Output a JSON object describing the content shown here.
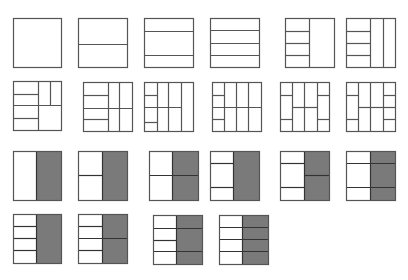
{
  "diagram": {
    "colors": {
      "background": "#ffffff",
      "stroke": "#555555",
      "stroke_dark": "#333333",
      "shade": "#7a7a7a"
    },
    "squares": [
      {
        "id": "r1c1",
        "x": 13,
        "y": 18,
        "w": 48,
        "h": 49,
        "shade": null,
        "lines": []
      },
      {
        "id": "r1c2",
        "x": 78,
        "y": 18,
        "w": 49,
        "h": 49,
        "shade": null,
        "lines": [
          [
            78,
            44,
            127,
            44
          ]
        ]
      },
      {
        "id": "r1c3",
        "x": 144,
        "y": 18,
        "w": 49,
        "h": 49,
        "shade": null,
        "lines": [
          [
            144,
            31,
            193,
            31
          ],
          [
            144,
            55,
            193,
            55
          ]
        ]
      },
      {
        "id": "r1c4",
        "x": 210,
        "y": 18,
        "w": 49,
        "h": 49,
        "shade": null,
        "lines": [
          [
            210,
            30,
            259,
            30
          ],
          [
            210,
            43,
            259,
            43
          ],
          [
            210,
            55,
            259,
            55
          ]
        ]
      },
      {
        "id": "r1c5",
        "x": 285,
        "y": 18,
        "w": 49,
        "h": 49,
        "shade": null,
        "lines": [
          [
            309,
            18,
            309,
            67
          ],
          [
            285,
            31,
            309,
            31
          ],
          [
            285,
            43,
            309,
            43
          ],
          [
            285,
            55,
            309,
            55
          ]
        ]
      },
      {
        "id": "r1c6",
        "x": 346,
        "y": 18,
        "w": 49,
        "h": 49,
        "shade": null,
        "lines": [
          [
            370,
            18,
            370,
            67
          ],
          [
            383,
            18,
            383,
            67
          ],
          [
            346,
            31,
            370,
            31
          ],
          [
            346,
            43,
            370,
            43
          ],
          [
            346,
            55,
            370,
            55
          ]
        ]
      },
      {
        "id": "r2c1",
        "x": 13,
        "y": 81,
        "w": 48,
        "h": 49,
        "shade": null,
        "lines": [
          [
            38,
            81,
            38,
            130
          ],
          [
            13,
            105,
            61,
            105
          ],
          [
            13,
            94,
            38,
            94
          ],
          [
            50,
            81,
            50,
            105
          ],
          [
            13,
            118,
            38,
            118
          ]
        ]
      },
      {
        "id": "r2c2",
        "x": 83,
        "y": 82,
        "w": 49,
        "h": 49,
        "shade": null,
        "lines": [
          [
            108,
            82,
            108,
            131
          ],
          [
            119,
            82,
            119,
            131
          ],
          [
            83,
            108,
            132,
            108
          ],
          [
            83,
            95,
            108,
            95
          ],
          [
            83,
            119,
            108,
            119
          ]
        ]
      },
      {
        "id": "r2c3",
        "x": 144,
        "y": 82,
        "w": 49,
        "h": 49,
        "shade": null,
        "lines": [
          [
            157,
            82,
            157,
            131
          ],
          [
            168,
            82,
            168,
            131
          ],
          [
            181,
            82,
            181,
            131
          ],
          [
            144,
            107,
            181,
            107
          ],
          [
            144,
            95,
            157,
            95
          ],
          [
            144,
            122,
            157,
            122
          ]
        ]
      },
      {
        "id": "r2c4",
        "x": 212,
        "y": 82,
        "w": 49,
        "h": 49,
        "shade": null,
        "lines": [
          [
            224,
            82,
            224,
            131
          ],
          [
            236,
            82,
            236,
            131
          ],
          [
            248,
            82,
            248,
            131
          ],
          [
            212,
            107,
            261,
            107
          ],
          [
            212,
            95,
            224,
            95
          ],
          [
            212,
            119,
            224,
            119
          ]
        ]
      },
      {
        "id": "r2c5",
        "x": 280,
        "y": 82,
        "w": 49,
        "h": 49,
        "shade": null,
        "lines": [
          [
            292,
            82,
            292,
            131
          ],
          [
            304,
            82,
            304,
            131
          ],
          [
            317,
            82,
            317,
            131
          ],
          [
            292,
            107,
            317,
            107
          ],
          [
            280,
            95,
            292,
            95
          ],
          [
            280,
            119,
            292,
            119
          ],
          [
            317,
            95,
            329,
            95
          ],
          [
            317,
            119,
            329,
            119
          ]
        ]
      },
      {
        "id": "r2c6",
        "x": 346,
        "y": 82,
        "w": 49,
        "h": 49,
        "shade": null,
        "lines": [
          [
            358,
            82,
            358,
            131
          ],
          [
            370,
            82,
            370,
            131
          ],
          [
            383,
            82,
            383,
            131
          ],
          [
            358,
            107,
            383,
            107
          ],
          [
            346,
            95,
            358,
            95
          ],
          [
            346,
            119,
            358,
            119
          ],
          [
            383,
            95,
            395,
            95
          ],
          [
            383,
            107,
            395,
            107
          ],
          [
            383,
            119,
            395,
            119
          ]
        ]
      },
      {
        "id": "r3c1",
        "x": 13,
        "y": 151,
        "w": 48,
        "h": 49,
        "shade": {
          "x": 36,
          "w": 25
        },
        "lines": [
          [
            36,
            151,
            36,
            200
          ]
        ]
      },
      {
        "id": "r3c2",
        "x": 78,
        "y": 151,
        "w": 49,
        "h": 49,
        "shade": {
          "x": 102,
          "w": 25
        },
        "lines": [
          [
            102,
            151,
            102,
            200
          ],
          [
            78,
            175,
            102,
            175
          ]
        ]
      },
      {
        "id": "r3c3",
        "x": 149,
        "y": 151,
        "w": 49,
        "h": 49,
        "shade": {
          "x": 172,
          "w": 26
        },
        "lines": [
          [
            172,
            151,
            172,
            200
          ],
          [
            149,
            175,
            198,
            175
          ]
        ]
      },
      {
        "id": "r3c4",
        "x": 210,
        "y": 151,
        "w": 49,
        "h": 49,
        "shade": {
          "x": 233,
          "w": 26
        },
        "lines": [
          [
            233,
            151,
            233,
            200
          ],
          [
            210,
            163,
            233,
            163
          ],
          [
            210,
            187,
            233,
            187
          ]
        ]
      },
      {
        "id": "r3c5",
        "x": 280,
        "y": 151,
        "w": 49,
        "h": 49,
        "shade": {
          "x": 304,
          "w": 25
        },
        "lines": [
          [
            304,
            151,
            304,
            200
          ],
          [
            280,
            163,
            304,
            163
          ],
          [
            280,
            187,
            304,
            187
          ],
          [
            304,
            175,
            329,
            175
          ]
        ]
      },
      {
        "id": "r3c6",
        "x": 346,
        "y": 151,
        "w": 49,
        "h": 49,
        "shade": {
          "x": 370,
          "w": 25
        },
        "lines": [
          [
            370,
            151,
            370,
            200
          ],
          [
            346,
            163,
            395,
            163
          ],
          [
            346,
            187,
            395,
            187
          ]
        ]
      },
      {
        "id": "r4c1",
        "x": 13,
        "y": 214,
        "w": 48,
        "h": 49,
        "shade": {
          "x": 36,
          "w": 25
        },
        "lines": [
          [
            36,
            214,
            36,
            263
          ],
          [
            13,
            226,
            36,
            226
          ],
          [
            13,
            238,
            36,
            238
          ],
          [
            13,
            250,
            36,
            250
          ]
        ]
      },
      {
        "id": "r4c2",
        "x": 78,
        "y": 214,
        "w": 49,
        "h": 49,
        "shade": {
          "x": 102,
          "w": 25
        },
        "lines": [
          [
            102,
            214,
            102,
            263
          ],
          [
            78,
            226,
            102,
            226
          ],
          [
            78,
            238,
            127,
            238
          ],
          [
            78,
            250,
            102,
            250
          ]
        ]
      },
      {
        "id": "r4c3",
        "x": 153,
        "y": 215,
        "w": 49,
        "h": 49,
        "shade": {
          "x": 176,
          "w": 26
        },
        "lines": [
          [
            176,
            215,
            176,
            264
          ],
          [
            153,
            228,
            202,
            228
          ],
          [
            153,
            240,
            176,
            240
          ],
          [
            153,
            251,
            202,
            251
          ]
        ]
      },
      {
        "id": "r4c4",
        "x": 219,
        "y": 215,
        "w": 49,
        "h": 49,
        "shade": {
          "x": 242,
          "w": 26
        },
        "lines": [
          [
            242,
            215,
            242,
            264
          ],
          [
            219,
            227,
            268,
            227
          ],
          [
            219,
            239,
            268,
            239
          ],
          [
            219,
            251,
            268,
            251
          ]
        ]
      }
    ]
  }
}
